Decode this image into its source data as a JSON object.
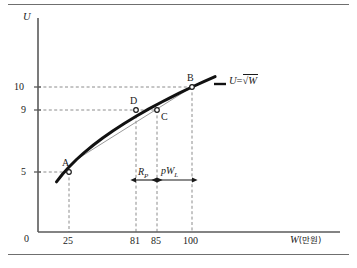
{
  "figure": {
    "background_color": "#ffffff",
    "rule_color": "#6f6f6f",
    "axis_color": "#5a5a5a",
    "curve_color": "#111111",
    "chord_color": "#9a9a9a",
    "guide_color": "#8c8c8c",
    "text_color": "#1a1a1a"
  },
  "axes": {
    "y_title": "U",
    "x_title_symbol": "W",
    "x_title_unit": "(만원)",
    "origin_label": "0",
    "y_ticks": [
      {
        "label": "10",
        "value": 10
      },
      {
        "label": "9",
        "value": 9
      },
      {
        "label": "5",
        "value": 5
      }
    ],
    "x_ticks": [
      {
        "label": "25",
        "value": 25
      },
      {
        "label": "81",
        "value": 81
      },
      {
        "label": "85",
        "value": 85
      },
      {
        "label": "100",
        "value": 100
      }
    ]
  },
  "equation": {
    "lhs": "U",
    "eq": "=",
    "radical": "√",
    "rhs": "W",
    "full": "U = √W"
  },
  "points": [
    {
      "id": "A",
      "label": "A",
      "x": 25,
      "y": 5
    },
    {
      "id": "B",
      "label": "B",
      "x": 100,
      "y": 10
    },
    {
      "id": "C",
      "label": "C",
      "x": 85,
      "y": 9
    },
    {
      "id": "D",
      "label": "D",
      "x": 81,
      "y": 9
    }
  ],
  "annotations": [
    {
      "id": "risk-premium",
      "symbol": "R",
      "subscript": "P",
      "from_x": 81,
      "to_x": 85
    },
    {
      "id": "expected-loss",
      "prefix": "p",
      "symbol": "W",
      "subscript": "L",
      "from_x": 85,
      "to_x": 100
    }
  ],
  "chart_data": {
    "type": "line",
    "title": "",
    "xlabel": "W(만원)",
    "ylabel": "U",
    "xlim": [
      0,
      118
    ],
    "ylim": [
      0,
      13.5
    ],
    "grid": false,
    "legend": "U = √W",
    "series": [
      {
        "name": "U = √W",
        "style": "thick-solid-curve",
        "x": [
          12,
          16,
          20,
          25,
          30,
          36,
          42,
          49,
          56,
          64,
          72,
          81,
          85,
          92,
          100,
          108,
          115
        ],
        "y": [
          3.46,
          4.0,
          4.47,
          5.0,
          5.48,
          6.0,
          6.48,
          7.0,
          7.48,
          8.0,
          8.49,
          9.0,
          9.22,
          9.59,
          10.0,
          10.39,
          10.72
        ]
      },
      {
        "name": "chord A-B",
        "style": "thin-solid-line",
        "x": [
          25,
          100
        ],
        "y": [
          5,
          10
        ]
      }
    ],
    "markers": [
      {
        "label": "A",
        "x": 25,
        "y": 5
      },
      {
        "label": "D",
        "x": 81,
        "y": 9
      },
      {
        "label": "C",
        "x": 85,
        "y": 9
      },
      {
        "label": "B",
        "x": 100,
        "y": 10
      }
    ],
    "guides": [
      {
        "type": "horizontal",
        "y": 10,
        "from_x": 0,
        "to_x": 100
      },
      {
        "type": "horizontal",
        "y": 9,
        "from_x": 0,
        "to_x": 85
      },
      {
        "type": "horizontal",
        "y": 5,
        "from_x": 0,
        "to_x": 25
      },
      {
        "type": "vertical",
        "x": 25,
        "from_y": 0,
        "to_y": 5
      },
      {
        "type": "vertical",
        "x": 81,
        "from_y": 0,
        "to_y": 9
      },
      {
        "type": "vertical",
        "x": 85,
        "from_y": 0,
        "to_y": 9
      },
      {
        "type": "vertical",
        "x": 100,
        "from_y": 0,
        "to_y": 10
      }
    ],
    "span_arrows": [
      {
        "label": "R_P",
        "from_x": 81,
        "to_x": 85,
        "y": 5.2
      },
      {
        "label": "pW_L",
        "from_x": 85,
        "to_x": 100,
        "y": 5.2
      }
    ]
  }
}
